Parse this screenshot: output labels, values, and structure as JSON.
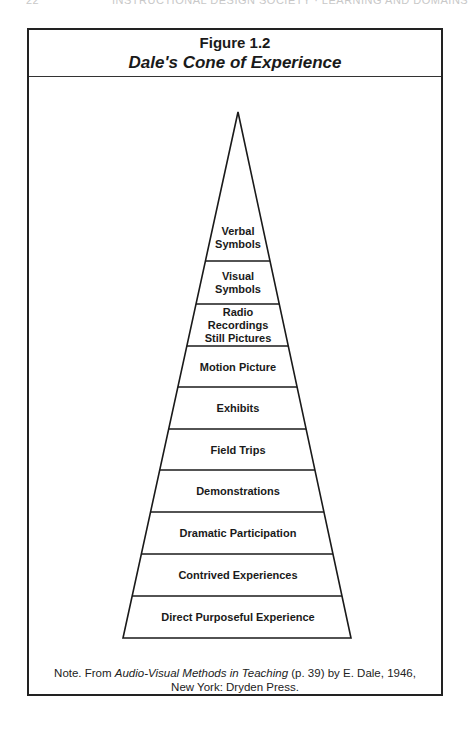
{
  "running_header": {
    "page_number": "22",
    "title": "INSTRUCTIONAL DESIGN SOCIETY · LEARNING AND DOMAINS"
  },
  "figure": {
    "number": "Figure 1.2",
    "title": "Dale's Cone of Experience"
  },
  "cone": {
    "apex": [
      238,
      112
    ],
    "base_left_x": 123,
    "base_right_x": 351,
    "base_y": 638,
    "stroke_color": "#1a1a1a",
    "bands": [
      {
        "lines": [
          "Verbal",
          "Symbols"
        ],
        "top": 112,
        "bottom": 261
      },
      {
        "lines": [
          "Visual",
          "Symbols"
        ],
        "top": 261,
        "bottom": 304
      },
      {
        "lines": [
          "Radio",
          "Recordings",
          "Still Pictures"
        ],
        "top": 304,
        "bottom": 346
      },
      {
        "lines": [
          "Motion Picture"
        ],
        "top": 346,
        "bottom": 387
      },
      {
        "lines": [
          "Exhibits"
        ],
        "top": 387,
        "bottom": 429
      },
      {
        "lines": [
          "Field Trips"
        ],
        "top": 429,
        "bottom": 470
      },
      {
        "lines": [
          "Demonstrations"
        ],
        "top": 470,
        "bottom": 512
      },
      {
        "lines": [
          "Dramatic Participation"
        ],
        "top": 512,
        "bottom": 554
      },
      {
        "lines": [
          "Contrived Experiences"
        ],
        "top": 554,
        "bottom": 596
      },
      {
        "lines": [
          "Direct Purposeful Experience"
        ],
        "top": 596,
        "bottom": 638
      }
    ]
  },
  "note": {
    "prefix": "Note.  From ",
    "source_title": "Audio-Visual Methods in Teaching",
    "suffix": " (p. 39) by E. Dale, 1946,",
    "line2": "New York: Dryden Press."
  }
}
